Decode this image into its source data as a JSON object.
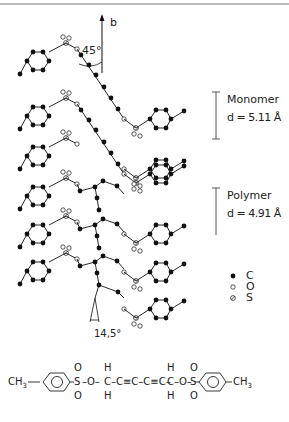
{
  "axis": {
    "label": "b",
    "angle_label": "45°"
  },
  "spacing": {
    "monomer": {
      "label": "Monomer",
      "d": "d = 5.11 Å"
    },
    "polymer": {
      "label": "Polymer",
      "d": "d = 4.91 Å"
    }
  },
  "tilt_angle": "14,5°",
  "legend": [
    {
      "symbol": "filled-circle",
      "atom": "C"
    },
    {
      "symbol": "open-circle",
      "atom": "O"
    },
    {
      "symbol": "hatched-circle",
      "atom": "S"
    }
  ],
  "formula": {
    "left_group": "CH3",
    "sulfonyl_left": "S",
    "o_left": "O",
    "chain": "C≡C–C≡C",
    "o_right": "O",
    "sulfonyl_right": "S",
    "right_group": "CH3",
    "h": "H",
    "o_dbl": "O",
    "c": "C"
  },
  "colors": {
    "ink": "#111111",
    "border": "#777777"
  }
}
